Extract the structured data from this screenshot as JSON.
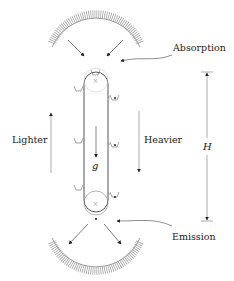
{
  "diagram": {
    "type": "perpetual-motion-photon-elevator",
    "labels": {
      "absorption": "Absorption",
      "emission": "Emission",
      "lighter": "Lighter",
      "heavier": "Heavier",
      "height": "H",
      "gravity": "g"
    },
    "elements": {
      "top_mirror": "curved reflector (hatched) above top pulley",
      "bottom_mirror": "curved reflector (hatched) below bottom pulley",
      "belt": "vertical conveyor belt loop around two pulleys",
      "left_buckets": "lighter (empty) buckets rising on the left",
      "right_buckets": "heavier (filled) buckets descending on the right"
    },
    "colors": {
      "stroke": "#333333",
      "light_stroke": "#999999",
      "background": "#ffffff"
    }
  }
}
